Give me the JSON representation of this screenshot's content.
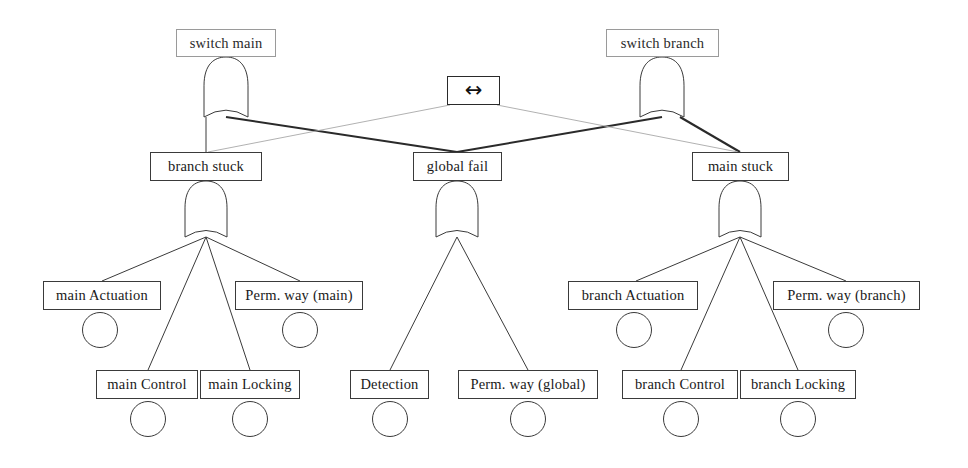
{
  "diagram": {
    "type": "fault-tree",
    "canvas": {
      "width": 968,
      "height": 468
    },
    "colors": {
      "background": "#ffffff",
      "stroke": "#3a3a3a",
      "faint_stroke": "#9a9a9a",
      "text": "#1a1a1a",
      "edge": "#2a2a2a",
      "faint_edge": "#a8a8a8"
    }
  },
  "nodes": {
    "switch_main": {
      "label": "switch main",
      "kind": "top-event",
      "gate": "or",
      "box": {
        "x": 176,
        "y": 29,
        "w": 100,
        "h": 28
      },
      "faint": true
    },
    "switch_branch": {
      "label": "switch branch",
      "kind": "top-event",
      "gate": "or",
      "box": {
        "x": 606,
        "y": 29,
        "w": 113,
        "h": 28
      },
      "faint": true
    },
    "symmetry": {
      "label": "↔",
      "icon": "left-right-arrow-icon",
      "kind": "symmetry-marker",
      "box": {
        "x": 447,
        "y": 76,
        "w": 53,
        "h": 29
      }
    },
    "branch_stuck": {
      "label": "branch stuck",
      "kind": "intermediate-event",
      "gate": "or",
      "box": {
        "x": 150,
        "y": 152,
        "w": 112,
        "h": 29
      }
    },
    "global_fail": {
      "label": "global fail",
      "kind": "intermediate-event",
      "gate": "or",
      "box": {
        "x": 413,
        "y": 152,
        "w": 89,
        "h": 29
      }
    },
    "main_stuck": {
      "label": "main stuck",
      "kind": "intermediate-event",
      "gate": "or",
      "box": {
        "x": 692,
        "y": 152,
        "w": 97,
        "h": 29
      }
    },
    "main_actuation": {
      "label": "main Actuation",
      "kind": "basic-event",
      "box": {
        "x": 43,
        "y": 281,
        "w": 118,
        "h": 29
      },
      "circle": {
        "cx": 100,
        "cy": 330,
        "r": 18
      }
    },
    "main_control": {
      "label": "main Control",
      "kind": "basic-event",
      "box": {
        "x": 96,
        "y": 370,
        "w": 102,
        "h": 29
      },
      "circle": {
        "cx": 148,
        "cy": 419,
        "r": 18
      }
    },
    "main_locking": {
      "label": "main Locking",
      "kind": "basic-event",
      "box": {
        "x": 200,
        "y": 370,
        "w": 100,
        "h": 29
      },
      "circle": {
        "cx": 250,
        "cy": 419,
        "r": 18
      }
    },
    "perm_way_main": {
      "label": "Perm. way (main)",
      "kind": "basic-event",
      "box": {
        "x": 235,
        "y": 281,
        "w": 128,
        "h": 29
      },
      "circle": {
        "cx": 300,
        "cy": 330,
        "r": 18
      }
    },
    "detection": {
      "label": "Detection",
      "kind": "basic-event",
      "box": {
        "x": 350,
        "y": 370,
        "w": 79,
        "h": 29
      },
      "circle": {
        "cx": 390,
        "cy": 419,
        "r": 18
      }
    },
    "perm_way_global": {
      "label": "Perm. way (global)",
      "kind": "basic-event",
      "box": {
        "x": 458,
        "y": 370,
        "w": 140,
        "h": 29
      },
      "circle": {
        "cx": 528,
        "cy": 419,
        "r": 18
      }
    },
    "branch_actuation": {
      "label": "branch Actuation",
      "kind": "basic-event",
      "box": {
        "x": 568,
        "y": 281,
        "w": 130,
        "h": 29
      },
      "circle": {
        "cx": 634,
        "cy": 330,
        "r": 18
      }
    },
    "branch_control": {
      "label": "branch Control",
      "kind": "basic-event",
      "box": {
        "x": 622,
        "y": 370,
        "w": 116,
        "h": 29
      },
      "circle": {
        "cx": 681,
        "cy": 419,
        "r": 18
      }
    },
    "branch_locking": {
      "label": "branch Locking",
      "kind": "basic-event",
      "box": {
        "x": 740,
        "y": 370,
        "w": 116,
        "h": 29
      },
      "circle": {
        "cx": 798,
        "cy": 419,
        "r": 18
      }
    },
    "perm_way_branch": {
      "label": "Perm. way (branch)",
      "kind": "basic-event",
      "box": {
        "x": 773,
        "y": 281,
        "w": 147,
        "h": 29
      },
      "circle": {
        "cx": 846,
        "cy": 330,
        "r": 18
      }
    }
  },
  "gates": [
    {
      "id": "gate-switch-main",
      "type": "or",
      "cx": 226,
      "top": 57,
      "bottom": 117,
      "width": 44
    },
    {
      "id": "gate-switch-branch",
      "type": "or",
      "cx": 662,
      "top": 57,
      "bottom": 117,
      "width": 44
    },
    {
      "id": "gate-branch-stuck",
      "type": "or",
      "cx": 206,
      "top": 181,
      "bottom": 237,
      "width": 42
    },
    {
      "id": "gate-global-fail",
      "type": "or",
      "cx": 457,
      "top": 181,
      "bottom": 237,
      "width": 42
    },
    {
      "id": "gate-main-stuck",
      "type": "or",
      "cx": 740,
      "top": 181,
      "bottom": 237,
      "width": 42
    }
  ],
  "edges": [
    {
      "from": "gate-switch-main",
      "to": "branch_stuck",
      "x1": 206,
      "y1": 117,
      "x2": 206,
      "y2": 152,
      "weight": "normal"
    },
    {
      "from": "gate-switch-main",
      "to": "global_fail",
      "x1": 226,
      "y1": 117,
      "x2": 457,
      "y2": 152,
      "weight": "bold"
    },
    {
      "from": "gate-switch-branch",
      "to": "global_fail",
      "x1": 662,
      "y1": 117,
      "x2": 457,
      "y2": 152,
      "weight": "bold"
    },
    {
      "from": "gate-switch-branch",
      "to": "main_stuck",
      "x1": 680,
      "y1": 117,
      "x2": 740,
      "y2": 152,
      "weight": "bold"
    },
    {
      "from": "symmetry",
      "to": "branch_stuck",
      "x1": 450,
      "y1": 105,
      "x2": 208,
      "y2": 152,
      "weight": "faint"
    },
    {
      "from": "symmetry",
      "to": "main_stuck",
      "x1": 497,
      "y1": 105,
      "x2": 738,
      "y2": 152,
      "weight": "faint"
    },
    {
      "from": "gate-branch-stuck",
      "to": "main_actuation",
      "x1": 206,
      "y1": 237,
      "x2": 102,
      "y2": 281,
      "weight": "normal"
    },
    {
      "from": "gate-branch-stuck",
      "to": "main_control",
      "x1": 206,
      "y1": 237,
      "x2": 148,
      "y2": 370,
      "weight": "normal"
    },
    {
      "from": "gate-branch-stuck",
      "to": "main_locking",
      "x1": 206,
      "y1": 237,
      "x2": 250,
      "y2": 370,
      "weight": "normal"
    },
    {
      "from": "gate-branch-stuck",
      "to": "perm_way_main",
      "x1": 206,
      "y1": 237,
      "x2": 300,
      "y2": 281,
      "weight": "normal"
    },
    {
      "from": "gate-global-fail",
      "to": "detection",
      "x1": 457,
      "y1": 237,
      "x2": 390,
      "y2": 370,
      "weight": "normal"
    },
    {
      "from": "gate-global-fail",
      "to": "perm_way_global",
      "x1": 457,
      "y1": 237,
      "x2": 528,
      "y2": 370,
      "weight": "normal"
    },
    {
      "from": "gate-main-stuck",
      "to": "branch_actuation",
      "x1": 740,
      "y1": 237,
      "x2": 636,
      "y2": 281,
      "weight": "normal"
    },
    {
      "from": "gate-main-stuck",
      "to": "branch_control",
      "x1": 740,
      "y1": 237,
      "x2": 681,
      "y2": 370,
      "weight": "normal"
    },
    {
      "from": "gate-main-stuck",
      "to": "branch_locking",
      "x1": 740,
      "y1": 237,
      "x2": 798,
      "y2": 370,
      "weight": "normal"
    },
    {
      "from": "gate-main-stuck",
      "to": "perm_way_branch",
      "x1": 740,
      "y1": 237,
      "x2": 846,
      "y2": 281,
      "weight": "normal"
    }
  ]
}
